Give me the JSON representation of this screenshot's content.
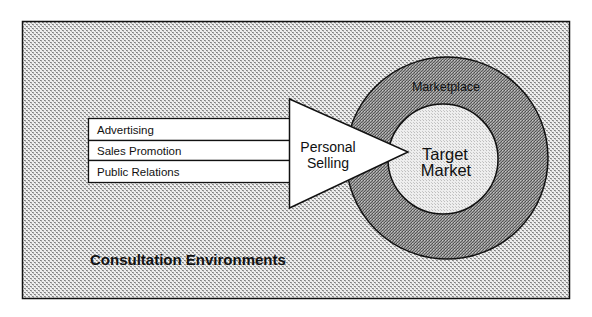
{
  "diagram": {
    "environment_label": "Consultation Environments",
    "channels": [
      "Advertising",
      "Sales Promotion",
      "Public Relations"
    ],
    "arrow_label": [
      "Personal",
      "Selling"
    ],
    "outer_ring_label": "Marketplace",
    "inner_circle_label": [
      "Target",
      "Market"
    ]
  },
  "colors": {
    "background_pattern_dark": "#8c8c8c",
    "background_pattern_light": "#f2f2f2",
    "ring_dark": "#5a5a5a",
    "ring_light": "#b4b4b4",
    "inner_dark": "#bcbcbc",
    "inner_light": "#f4f4f4",
    "stroke": "#111111"
  }
}
